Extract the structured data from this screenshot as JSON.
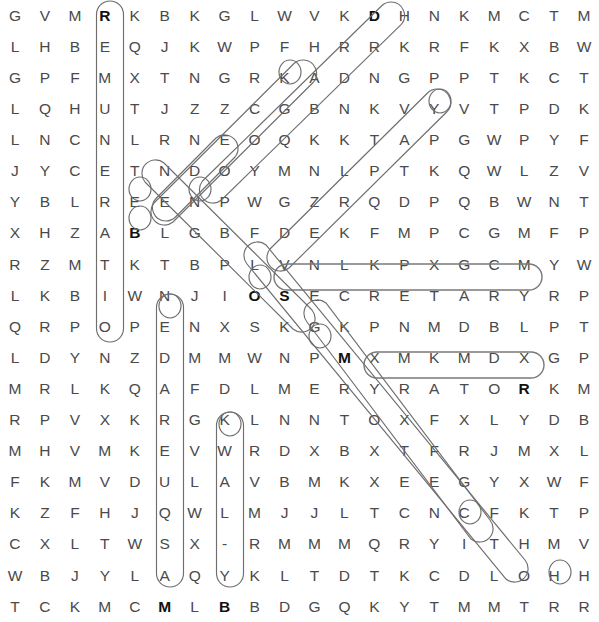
{
  "puzzle": {
    "type": "word-search",
    "rows": 21,
    "cols": 20,
    "letter_color": "#4a4a4a",
    "highlight_color": "#6e6e6e",
    "background": "#ffffff",
    "grid": [
      [
        "G",
        "V",
        "M",
        "R",
        "K",
        "B",
        "K",
        "G",
        "L",
        "W",
        "V",
        "K",
        "D",
        "H",
        "N",
        "K",
        "M",
        "C",
        "T",
        "M"
      ],
      [
        "L",
        "H",
        "B",
        "E",
        "Q",
        "J",
        "K",
        "W",
        "P",
        "F",
        "H",
        "R",
        "R",
        "K",
        "R",
        "F",
        "K",
        "X",
        "B",
        "W"
      ],
      [
        "G",
        "P",
        "F",
        "M",
        "X",
        "T",
        "N",
        "G",
        "R",
        "K",
        "A",
        "D",
        "N",
        "G",
        "P",
        "P",
        "T",
        "K",
        "C",
        "T"
      ],
      [
        "L",
        "Q",
        "H",
        "U",
        "T",
        "J",
        "Z",
        "Z",
        "C",
        "G",
        "B",
        "N",
        "K",
        "V",
        "Y",
        "V",
        "T",
        "P",
        "D",
        "K"
      ],
      [
        "L",
        "N",
        "C",
        "N",
        "L",
        "R",
        "N",
        "E",
        "O",
        "Q",
        "K",
        "K",
        "T",
        "A",
        "P",
        "G",
        "W",
        "P",
        "Y",
        "F"
      ],
      [
        "J",
        "Y",
        "C",
        "E",
        "T",
        "N",
        "D",
        "O",
        "Y",
        "M",
        "N",
        "L",
        "P",
        "T",
        "K",
        "Q",
        "W",
        "L",
        "Z",
        "V"
      ],
      [
        "Y",
        "B",
        "L",
        "R",
        "E",
        "E",
        "N",
        "P",
        "W",
        "G",
        "Z",
        "R",
        "Q",
        "D",
        "P",
        "Q",
        "B",
        "W",
        "N",
        "T"
      ],
      [
        "X",
        "H",
        "Z",
        "A",
        "B",
        "L",
        "G",
        "B",
        "F",
        "D",
        "E",
        "K",
        "F",
        "M",
        "P",
        "C",
        "G",
        "M",
        "F",
        "P"
      ],
      [
        "R",
        "Z",
        "M",
        "T",
        "K",
        "T",
        "B",
        "P",
        "L",
        "V",
        "N",
        "L",
        "K",
        "P",
        "X",
        "G",
        "C",
        "M",
        "Y",
        "W"
      ],
      [
        "L",
        "K",
        "B",
        "I",
        "W",
        "N",
        "J",
        "I",
        "O",
        "S",
        "E",
        "C",
        "R",
        "E",
        "T",
        "A",
        "R",
        "Y",
        "R",
        "P"
      ],
      [
        "Q",
        "R",
        "P",
        "O",
        "P",
        "E",
        "N",
        "X",
        "S",
        "K",
        "G",
        "K",
        "P",
        "N",
        "M",
        "D",
        "B",
        "L",
        "P",
        "T"
      ],
      [
        "L",
        "D",
        "Y",
        "N",
        "Z",
        "D",
        "M",
        "M",
        "W",
        "N",
        "P",
        "M",
        "X",
        "M",
        "K",
        "M",
        "D",
        "X",
        "G",
        "P"
      ],
      [
        "M",
        "R",
        "L",
        "K",
        "Q",
        "A",
        "F",
        "D",
        "L",
        "M",
        "E",
        "R",
        "Y",
        "R",
        "A",
        "T",
        "O",
        "R",
        "K",
        "M"
      ],
      [
        "R",
        "P",
        "V",
        "X",
        "K",
        "R",
        "G",
        "K",
        "L",
        "N",
        "N",
        "T",
        "O",
        "X",
        "F",
        "X",
        "L",
        "Y",
        "D",
        "B"
      ],
      [
        "M",
        "H",
        "V",
        "M",
        "K",
        "E",
        "V",
        "W",
        "R",
        "D",
        "X",
        "B",
        "X",
        "T",
        "F",
        "R",
        "J",
        "M",
        "X",
        "L"
      ],
      [
        "F",
        "K",
        "M",
        "V",
        "D",
        "U",
        "L",
        "A",
        "V",
        "B",
        "M",
        "K",
        "X",
        "E",
        "E",
        "G",
        "Y",
        "X",
        "W",
        "F"
      ],
      [
        "K",
        "Z",
        "F",
        "H",
        "J",
        "Q",
        "W",
        "L",
        "M",
        "J",
        "J",
        "L",
        "T",
        "C",
        "N",
        "C",
        "F",
        "K",
        "T",
        "P"
      ],
      [
        "C",
        "X",
        "L",
        "T",
        "W",
        "S",
        "X",
        "-",
        "R",
        "M",
        "M",
        "M",
        "Q",
        "R",
        "Y",
        "I",
        "T",
        "H",
        "M",
        "V"
      ],
      [
        "W",
        "B",
        "J",
        "Y",
        "L",
        "A",
        "Q",
        "Y",
        "K",
        "L",
        "T",
        "D",
        "T",
        "K",
        "C",
        "D",
        "L",
        "O",
        "H",
        "H"
      ],
      [
        "T",
        "C",
        "K",
        "M",
        "C",
        "M",
        "L",
        "B",
        "B",
        "D",
        "G",
        "Q",
        "K",
        "Y",
        "T",
        "M",
        "M",
        "T",
        "R",
        "R"
      ]
    ],
    "bold_cells": [
      {
        "row": 0,
        "col": 3
      },
      {
        "row": 0,
        "col": 12
      },
      {
        "row": 7,
        "col": 4
      },
      {
        "row": 9,
        "col": 8
      },
      {
        "row": 9,
        "col": 9
      },
      {
        "row": 11,
        "col": 11
      },
      {
        "row": 12,
        "col": 17
      },
      {
        "row": 19,
        "col": 5
      },
      {
        "row": 19,
        "col": 7
      }
    ],
    "found_words": [
      {
        "text": "REMUNERATION",
        "direction": "vertical-down",
        "start_row": 0,
        "start_col": 3,
        "length": 12
      },
      {
        "text": "MASQUERADE",
        "direction": "vertical-up",
        "start_row": 19,
        "start_col": 5,
        "length": 10
      },
      {
        "text": "BY-LAW",
        "direction": "vertical-up",
        "start_row": 19,
        "start_col": 7,
        "length": 6
      },
      {
        "text": "SECRETARY",
        "direction": "horizontal-right",
        "start_row": 9,
        "start_col": 9,
        "length": 9
      },
      {
        "text": "ROTARY",
        "direction": "horizontal-left",
        "start_row": 12,
        "start_col": 17,
        "length": 6
      },
      {
        "text": "DRAGON",
        "direction": "diagonal-down-left",
        "start_row": 0,
        "start_col": 12,
        "length": 6
      },
      {
        "text": "STOCK",
        "direction": "diagonal-down-left",
        "start_row": 2,
        "start_col": 10,
        "length": 5
      },
      {
        "text": "NEEDED",
        "direction": "diagonal-down-left",
        "start_row": 6,
        "start_col": 6,
        "length": 4
      },
      {
        "text": "YEARLY",
        "direction": "diagonal-down-left",
        "start_row": 3,
        "start_col": 14,
        "length": 6
      },
      {
        "text": "OBJECT",
        "direction": "diagonal-down-right",
        "start_row": 6,
        "start_col": 4,
        "length": 8
      },
      {
        "text": "PRINTER",
        "direction": "diagonal-down-right",
        "start_row": 11,
        "start_col": 11,
        "length": 8
      },
      {
        "text": "PROTECTOR",
        "direction": "diagonal-down-right",
        "start_row": 9,
        "start_col": 8,
        "length": 10
      }
    ]
  }
}
